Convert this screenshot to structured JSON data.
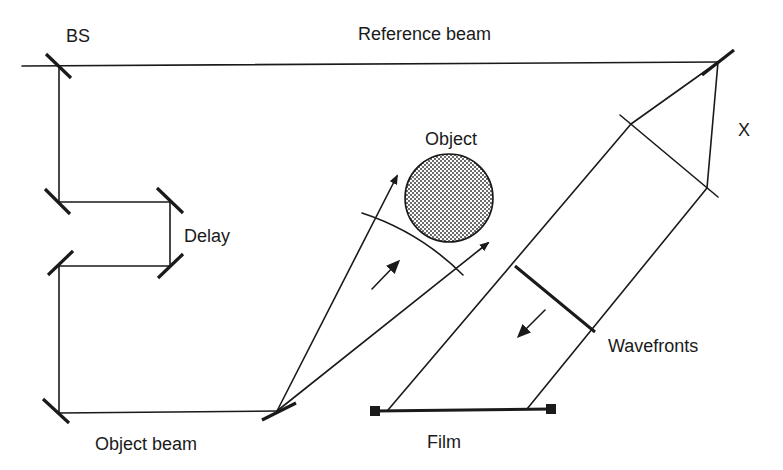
{
  "diagram": {
    "type": "holography-setup",
    "labels": {
      "beam_splitter": "BS",
      "reference_beam": "Reference beam",
      "delay": "Delay",
      "object": "Object",
      "x_marker": "X",
      "wavefronts": "Wavefronts",
      "object_beam": "Object beam",
      "film": "Film"
    },
    "colors": {
      "line": "#1a1a1a",
      "object_fill": "#b0b0b0",
      "background": "#ffffff"
    },
    "components": [
      {
        "id": "beam-splitter",
        "label": "BS",
        "pos": [
          59,
          65
        ]
      },
      {
        "id": "mirror-reference",
        "pos": [
          718,
          62
        ]
      },
      {
        "id": "mirror-delay-1",
        "pos": [
          59,
          202
        ]
      },
      {
        "id": "mirror-delay-2",
        "pos": [
          170,
          202
        ]
      },
      {
        "id": "mirror-delay-3",
        "pos": [
          170,
          266
        ]
      },
      {
        "id": "mirror-delay-4",
        "pos": [
          59,
          266
        ]
      },
      {
        "id": "mirror-bottom-left",
        "pos": [
          59,
          413
        ]
      },
      {
        "id": "mirror-object-beam",
        "pos": [
          277,
          411
        ]
      },
      {
        "id": "object",
        "label": "Object",
        "center": [
          449,
          198
        ],
        "radius": 44
      },
      {
        "id": "film",
        "label": "Film",
        "from": [
          375,
          411
        ],
        "to": [
          552,
          409
        ]
      }
    ]
  }
}
